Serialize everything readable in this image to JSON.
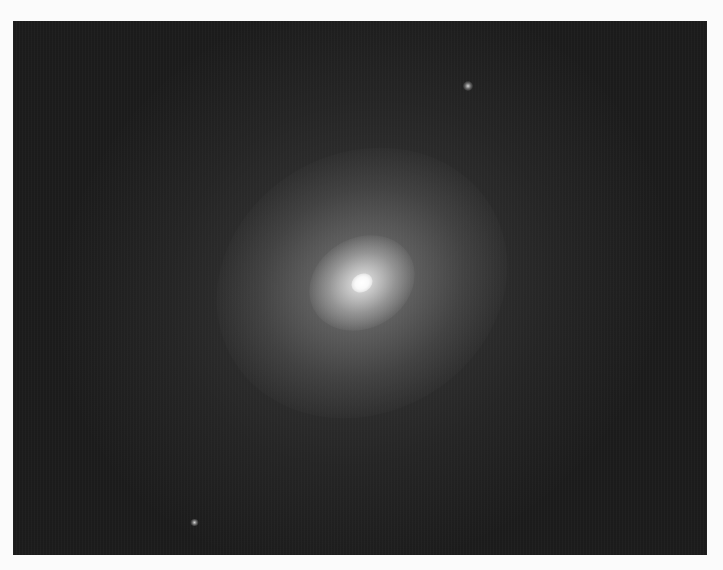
{
  "image": {
    "subject": "elliptical galaxy",
    "description": "Grayscale astronomical photograph of a diffuse elliptical galaxy with a bright compact core on a dark sky background, surrounded by a white border",
    "colors": {
      "border": "#fbfbfb",
      "sky": "#1c1c1c",
      "core": "#ffffff"
    },
    "features": [
      {
        "name": "galaxy-core",
        "position": [
          362,
          283
        ]
      },
      {
        "name": "faint-star-top-right",
        "position": [
          469,
          86
        ]
      },
      {
        "name": "faint-star-bottom-left",
        "position": [
          195,
          523
        ]
      }
    ]
  }
}
